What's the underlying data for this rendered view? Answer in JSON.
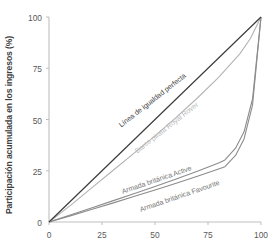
{
  "chart_data": {
    "type": "line",
    "title": "",
    "xlabel": "",
    "ylabel": "Participación acumulada en los ingresos (%)",
    "xlim": [
      0,
      100
    ],
    "ylim": [
      0,
      100
    ],
    "xticks": [
      "0",
      "25",
      "50",
      "75",
      "100"
    ],
    "yticks": [
      "0",
      "25",
      "50",
      "75",
      "100"
    ],
    "xtick_values": [
      0,
      25,
      50,
      75,
      100
    ],
    "ytick_values": [
      0,
      25,
      50,
      75,
      100
    ],
    "grid": false,
    "legend_position": "inline-annotations",
    "series": [
      {
        "name": "Línea de igualdad perfecta",
        "color": "#3c3c3c",
        "x": [
          0,
          100
        ],
        "values": [
          0,
          100
        ]
      },
      {
        "name": "Barco pirata Royal Rover",
        "color": "#b3b3b3",
        "x": [
          0,
          10,
          20,
          30,
          40,
          50,
          60,
          70,
          80,
          90,
          95,
          100
        ],
        "values": [
          0,
          8,
          16.5,
          25,
          33.5,
          42,
          51,
          60.5,
          70.5,
          82,
          89.5,
          100
        ]
      },
      {
        "name": "Armada británica Active",
        "color": "#8c8c8c",
        "x": [
          0,
          10,
          20,
          30,
          40,
          50,
          60,
          70,
          80,
          83,
          88,
          92,
          96,
          100
        ],
        "values": [
          0,
          3.4,
          6.8,
          10.3,
          13.8,
          17.3,
          21,
          24.8,
          28.8,
          30.3,
          36,
          44,
          60,
          100
        ]
      },
      {
        "name": "Armada británica Favourite",
        "color": "#8c8c8c",
        "x": [
          0,
          10,
          20,
          30,
          40,
          50,
          60,
          70,
          80,
          83,
          88,
          92,
          96,
          100
        ],
        "values": [
          0,
          3.0,
          6.1,
          9.2,
          12.4,
          15.6,
          18.9,
          22.3,
          25.9,
          27.0,
          32.5,
          40.5,
          57,
          100
        ]
      }
    ],
    "annotations": [
      {
        "text": "Línea de igualdad perfecta",
        "color": "#3c3c3c"
      },
      {
        "text": "Barco pirata Royal Rover",
        "color": "#b9b9b9"
      },
      {
        "text": "Armada británica Active",
        "color": "#777777"
      },
      {
        "text": "Armada británica Favourite",
        "color": "#777777"
      }
    ],
    "colors": {
      "equality_line": "#3c3c3c",
      "royal_rover": "#b3b3b3",
      "navy_ships": "#8c8c8c",
      "axis": "#bfbfbf",
      "tick_text": "#5a5a5a"
    }
  }
}
